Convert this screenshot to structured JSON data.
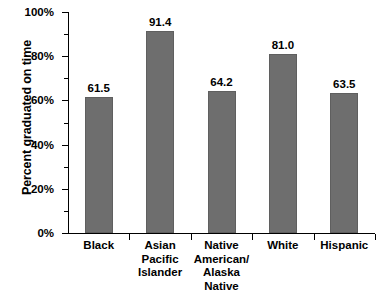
{
  "chart_data": {
    "type": "bar",
    "title": "",
    "xlabel": "",
    "ylabel": "Percent graduated on time",
    "categories": [
      "Black",
      "Asian Pacific\nIslander",
      "Native\nAmerican/\nAlaska Native",
      "White",
      "Hispanic"
    ],
    "values": [
      61.5,
      91.4,
      64.2,
      81.0,
      63.5
    ],
    "value_labels": [
      "61.5",
      "91.4",
      "64.2",
      "81.0",
      "63.5"
    ],
    "ylim": [
      0,
      100
    ],
    "ytick_labels": [
      "0%",
      "20%",
      "40%",
      "60%",
      "80%",
      "100%"
    ],
    "ytick_values": [
      0,
      20,
      40,
      60,
      80,
      100
    ],
    "yminor_tick_values": [
      10,
      30,
      50,
      70,
      90
    ],
    "grid": false,
    "legend": null,
    "bar_color": "#6e6e6e",
    "axis_color": "#000000",
    "text_color": "#000000"
  },
  "axis": {
    "y_title": "Percent graduated on time"
  }
}
